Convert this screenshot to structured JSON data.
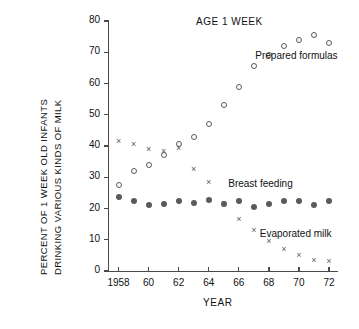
{
  "chart_data": {
    "type": "scatter",
    "title": "AGE 1 WEEK",
    "xlabel": "YEAR",
    "ylabel_line1": "PERCENT OF 1 WEEK OLD INFANTS",
    "ylabel_line2": "DRINKING VARIOUS KINDS OF MILK",
    "xlim": [
      1957.3,
      1972.6
    ],
    "ylim": [
      0,
      80
    ],
    "grid": false,
    "legend_position": "inline-annotations",
    "yticks": [
      0,
      10,
      20,
      30,
      40,
      50,
      60,
      70,
      80
    ],
    "ytick_labels": [
      "0",
      "10",
      "20",
      "30",
      "40",
      "50",
      "60",
      "70",
      "80"
    ],
    "xticks": [
      1958,
      1960,
      1962,
      1964,
      1966,
      1968,
      1970,
      1972
    ],
    "xtick_labels": [
      "1958",
      "60",
      "62",
      "64",
      "66",
      "68",
      "70",
      "72"
    ],
    "x": [
      1958,
      1959,
      1960,
      1961,
      1962,
      1963,
      1964,
      1965,
      1966,
      1967,
      1968,
      1969,
      1970,
      1971,
      1972
    ],
    "series": [
      {
        "name": "Prepared formulas",
        "marker": "open-circle",
        "color": "#5a5a5a",
        "values": [
          27.5,
          32,
          34,
          37,
          40.5,
          43,
          47,
          53,
          59,
          65.5,
          69,
          72,
          74,
          75.5,
          73
        ]
      },
      {
        "name": "Breast feeding",
        "marker": "filled-circle",
        "color": "#5a5a5a",
        "values": [
          23.8,
          22.3,
          21.2,
          21.5,
          22.5,
          21.7,
          22.6,
          21.4,
          22.3,
          20.6,
          21.5,
          22.5,
          22.3,
          21.2,
          22.5
        ]
      },
      {
        "name": "Evaporated milk",
        "marker": "cross",
        "color": "#5a5a5a",
        "values": [
          41.5,
          40.5,
          39,
          38.5,
          39.5,
          32.5,
          28.5,
          21.7,
          16.5,
          13,
          9.5,
          7,
          5,
          3.5,
          3.3
        ]
      }
    ],
    "annotations": [
      {
        "text": "Prepared formulas",
        "x": 1967.1,
        "y": 68.5
      },
      {
        "text": "Breast feeding",
        "x": 1965.3,
        "y": 27.5
      },
      {
        "text": "Evaporated milk",
        "x": 1967.4,
        "y": 11.5
      }
    ]
  }
}
